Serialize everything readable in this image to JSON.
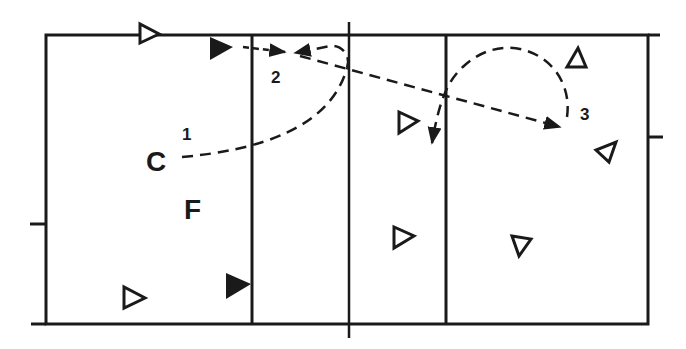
{
  "diagram": {
    "type": "court-play-diagram",
    "colors": {
      "ink": "#1a1a1a",
      "background": "#ffffff"
    },
    "labels": {
      "player_c": "C",
      "player_f": "F",
      "step_1": "1",
      "step_2": "2",
      "step_3": "3"
    },
    "markers": {
      "open_triangles": 8,
      "filled_triangles": 2
    }
  }
}
